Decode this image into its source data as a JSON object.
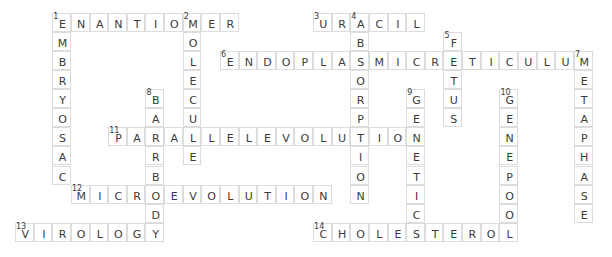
{
  "puzzle": {
    "grid": {
      "origin_x": 15,
      "origin_y": 12.7,
      "cell_w": 18.63,
      "cell_h": 19.1
    },
    "colors": {
      "border": "#dcdcdc",
      "text": "#3a3a3a",
      "background": "#ffffff"
    },
    "words": [
      {
        "number": 1,
        "direction": "across",
        "row": 0,
        "col": 2,
        "answer": "ENANTIOMER"
      },
      {
        "number": 1,
        "direction": "down",
        "row": 0,
        "col": 2,
        "answer": "EMBRYOSAC"
      },
      {
        "number": 2,
        "direction": "down",
        "row": 0,
        "col": 9,
        "answer": "MOLECULE"
      },
      {
        "number": 3,
        "direction": "across",
        "row": 0,
        "col": 16,
        "answer": "URACIL"
      },
      {
        "number": 4,
        "direction": "down",
        "row": 0,
        "col": 18,
        "answer": "ABSORPTION"
      },
      {
        "number": 5,
        "direction": "down",
        "row": 1,
        "col": 23,
        "answer": "FETUS"
      },
      {
        "number": 6,
        "direction": "across",
        "row": 2,
        "col": 11,
        "answer": "ENDOPLASMICRETICULUM"
      },
      {
        "number": 7,
        "direction": "down",
        "row": 2,
        "col": 30,
        "answer": "METAPHASE"
      },
      {
        "number": 8,
        "direction": "down",
        "row": 4,
        "col": 7,
        "answer": "BARRBODY"
      },
      {
        "number": 9,
        "direction": "down",
        "row": 4,
        "col": 21,
        "answer": "GENETIC"
      },
      {
        "number": 10,
        "direction": "down",
        "row": 4,
        "col": 26,
        "answer": "GENEPOOL"
      },
      {
        "number": 11,
        "direction": "across",
        "row": 6,
        "col": 5,
        "answer": "PARALLELEVOLUTION"
      },
      {
        "number": 12,
        "direction": "across",
        "row": 9,
        "col": 3,
        "answer": "MICROEVOLUTION"
      },
      {
        "number": 13,
        "direction": "across",
        "row": 11,
        "col": 0,
        "answer": "VIROLOGY"
      },
      {
        "number": 14,
        "direction": "across",
        "row": 11,
        "col": 16,
        "answer": "CHOLESTEROL"
      }
    ]
  }
}
